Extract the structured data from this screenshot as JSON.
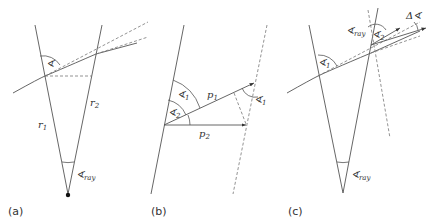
{
  "panels": [
    {
      "caption": "(a)",
      "labels": {
        "r1": "r",
        "r1_sub": "1",
        "r2": "r",
        "r2_sub": "2",
        "angle": "∢",
        "ray": "∢",
        "ray_sub": "ray"
      }
    },
    {
      "caption": "(b)",
      "labels": {
        "p1": "p",
        "p1_sub": "1",
        "p2": "p",
        "p2_sub": "2",
        "a1": "∢",
        "a1_sub": "1",
        "a2": "∢",
        "a2_sub": "2",
        "a1b": "∢",
        "a1b_sub": "1"
      }
    },
    {
      "caption": "(c)",
      "labels": {
        "a1": "∢",
        "a1_sub": "1",
        "ray_top": "∢",
        "ray_top_sub": "ray",
        "a2": "∢",
        "a2_sub": "2",
        "delta": "Δ∢",
        "ray": "∢",
        "ray_sub": "ray"
      }
    }
  ]
}
